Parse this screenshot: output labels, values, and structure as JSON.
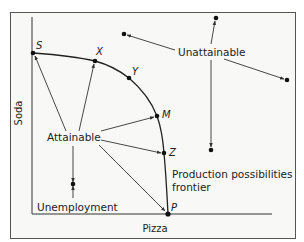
{
  "figure": {
    "type": "production-possibilities-frontier",
    "frame_color": "#555555",
    "background": "#f8f8f6",
    "line_color": "#333333",
    "axes": {
      "x_label": "Pizza",
      "y_label": "Soda"
    },
    "frontier_label_line1": "Production possibilities",
    "frontier_label_line2": "frontier",
    "points": {
      "S": "S",
      "X": "X",
      "Y": "Y",
      "M": "M",
      "Z": "Z",
      "P": "P"
    },
    "regions": {
      "attainable": "Attainable",
      "unattainable": "Unattainable",
      "unemployment": "Unemployment"
    }
  }
}
